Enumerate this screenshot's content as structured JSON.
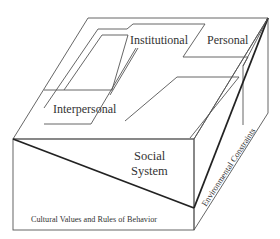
{
  "diagram": {
    "type": "3d-block-model",
    "colors": {
      "line": "#555555",
      "heavy_line": "#222222",
      "text": "#333333",
      "background": "#ffffff"
    },
    "labels": {
      "institutional": "Institutional",
      "personal": "Personal",
      "interpersonal": "Interpersonal",
      "social_line1": "Social",
      "social_line2": "System",
      "cultural": "Cultural Values and Rules of Behavior",
      "environmental": "Environmental Constraints"
    }
  }
}
